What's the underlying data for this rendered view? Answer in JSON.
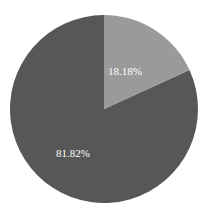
{
  "chart_data": {
    "type": "pie",
    "title": "",
    "categories": [
      "Slice A",
      "Slice B"
    ],
    "values": [
      18.18,
      81.82
    ],
    "labels": [
      "18.18%",
      "81.82%"
    ],
    "colors": [
      "#9a9a9a",
      "#575757"
    ],
    "start_angle": "12 o'clock, clockwise",
    "legend": "none"
  }
}
